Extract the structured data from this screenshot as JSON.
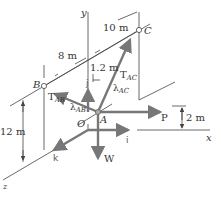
{
  "figure": {
    "points": {
      "B": "B",
      "C": "C",
      "A": "A",
      "O": "O"
    },
    "axes": {
      "x": "x",
      "y": "y",
      "z": "z"
    },
    "unit_vectors": {
      "i": "i",
      "j": "j",
      "k": "k"
    },
    "forces": {
      "T_AB": {
        "main": "T",
        "sub": "AB"
      },
      "T_AC": {
        "main": "T",
        "sub": "AC"
      },
      "lambda_AB": {
        "main": "λ",
        "sub": "AB"
      },
      "lambda_AC": {
        "main": "λ",
        "sub": "AC"
      },
      "P": "P",
      "W": "W"
    },
    "dimensions": {
      "d_8": "8 m",
      "d_10": "10 m",
      "d_1_2": "1.2 m",
      "d_12": "12 m",
      "d_2": "2 m"
    },
    "colors": {
      "line": "#444444",
      "arrow": "#777777",
      "text": "#333333"
    }
  }
}
